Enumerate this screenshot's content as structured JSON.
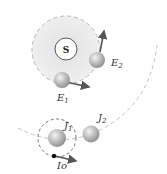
{
  "labels": {
    "sun": "S",
    "e1": "E",
    "e1_sub": "1",
    "e2": "E",
    "e2_sub": "2",
    "j1": "J",
    "j1_sub": "1",
    "j2": "J",
    "j2_sub": "2",
    "io": "Io"
  },
  "colors": {
    "orbit": "#b5b5b5",
    "sun_region": "#ececec",
    "arrow": "#555555",
    "sphere": "#a9a9a9"
  }
}
